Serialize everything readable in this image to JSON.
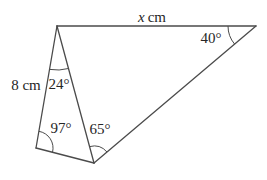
{
  "diagram": {
    "labels": {
      "top_side": {
        "variable": "x",
        "unit": "cm"
      },
      "left_side": "8 cm",
      "angle_top_right": "40°",
      "angle_apex": "24°",
      "angle_bottom_left": "97°",
      "angle_bottom_middle": "65°"
    },
    "colors": {
      "line": "#4b4b4b",
      "text": "#262626",
      "background": "#ffffff"
    }
  }
}
